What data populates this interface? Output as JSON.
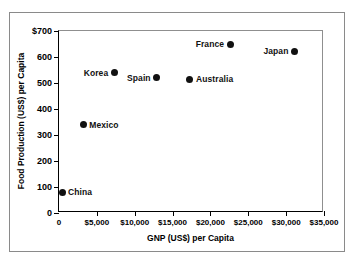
{
  "chart_data": {
    "type": "scatter",
    "title": "",
    "xlabel": "GNP (US$) per Capita",
    "ylabel": "Food Production (US$) per Capita",
    "xlim": [
      0,
      35000
    ],
    "ylim": [
      0,
      700
    ],
    "grid": false,
    "legend": "none",
    "point_labels_shown": true,
    "xticks": [
      {
        "value": 0,
        "label": "0"
      },
      {
        "value": 5000,
        "label": "$5,000"
      },
      {
        "value": 10000,
        "label": "$10,000"
      },
      {
        "value": 15000,
        "label": "$15,000"
      },
      {
        "value": 20000,
        "label": "$20,000"
      },
      {
        "value": 25000,
        "label": "$25,000"
      },
      {
        "value": 30000,
        "label": "$30,000"
      },
      {
        "value": 35000,
        "label": "$35,000"
      }
    ],
    "yticks": [
      {
        "value": 0,
        "label": "0"
      },
      {
        "value": 100,
        "label": "100"
      },
      {
        "value": 200,
        "label": "200"
      },
      {
        "value": 300,
        "label": "300"
      },
      {
        "value": 400,
        "label": "400"
      },
      {
        "value": 500,
        "label": "500"
      },
      {
        "value": 600,
        "label": "600"
      },
      {
        "value": 700,
        "label": "$700"
      }
    ],
    "points": [
      {
        "name": "China",
        "x": 400,
        "y": 80,
        "label": "China",
        "label_side": "right"
      },
      {
        "name": "Mexico",
        "x": 3200,
        "y": 340,
        "label": "Mexico",
        "label_side": "right"
      },
      {
        "name": "Korea",
        "x": 7300,
        "y": 540,
        "label": "Korea",
        "label_side": "left"
      },
      {
        "name": "Spain",
        "x": 12900,
        "y": 520,
        "label": "Spain",
        "label_side": "left"
      },
      {
        "name": "Australia",
        "x": 17300,
        "y": 515,
        "label": "Australia",
        "label_side": "right"
      },
      {
        "name": "France",
        "x": 22600,
        "y": 650,
        "label": "France",
        "label_side": "left"
      },
      {
        "name": "Japan",
        "x": 31100,
        "y": 623,
        "label": "Japan",
        "label_side": "left"
      }
    ],
    "marker": {
      "shape": "circle",
      "color": "#111111",
      "size": 7
    }
  },
  "colors": {
    "axis": "#000000",
    "frame": "#8a8a8a",
    "marker": "#111111",
    "background": "#ffffff"
  }
}
